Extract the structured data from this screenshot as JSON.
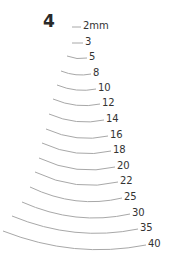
{
  "title": "4",
  "unit": "mm",
  "colors": {
    "arc": "#a8a8a8",
    "text": "#333333",
    "title": "#2a2a2a"
  },
  "sweeps": [
    {
      "label": "2mm",
      "y": 27,
      "x0": 72,
      "x1": 81,
      "sag": 0
    },
    {
      "label": "3",
      "y": 43,
      "x0": 72,
      "x1": 83,
      "sag": 0
    },
    {
      "label": "5",
      "y": 58,
      "x0": 67,
      "x1": 87,
      "sag": 2
    },
    {
      "label": "8",
      "y": 74,
      "x0": 61,
      "x1": 91,
      "sag": 3
    },
    {
      "label": "10",
      "y": 89,
      "x0": 57,
      "x1": 96,
      "sag": 4
    },
    {
      "label": "12",
      "y": 104,
      "x0": 53,
      "x1": 100,
      "sag": 5
    },
    {
      "label": "14",
      "y": 120,
      "x0": 49,
      "x1": 104,
      "sag": 6
    },
    {
      "label": "16",
      "y": 136,
      "x0": 46,
      "x1": 108,
      "sag": 7
    },
    {
      "label": "18",
      "y": 151,
      "x0": 42,
      "x1": 111,
      "sag": 8
    },
    {
      "label": "20",
      "y": 167,
      "x0": 39,
      "x1": 115,
      "sag": 9
    },
    {
      "label": "22",
      "y": 182,
      "x0": 35,
      "x1": 118,
      "sag": 10
    },
    {
      "label": "25",
      "y": 198,
      "x0": 30,
      "x1": 122,
      "sag": 11
    },
    {
      "label": "30",
      "y": 214,
      "x0": 22,
      "x1": 130,
      "sag": 12
    },
    {
      "label": "35",
      "y": 229,
      "x0": 12,
      "x1": 138,
      "sag": 13
    },
    {
      "label": "40",
      "y": 245,
      "x0": 3,
      "x1": 146,
      "sag": 14
    }
  ]
}
